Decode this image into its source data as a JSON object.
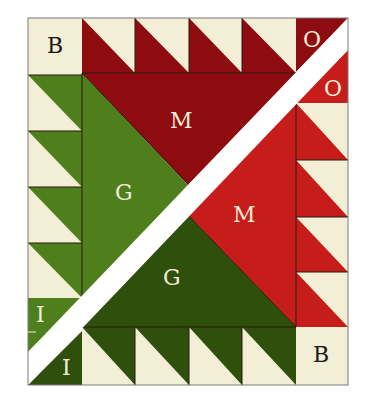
{
  "diagram": {
    "colors": {
      "cream": "#F3EED6",
      "dark_red": "#8E0C10",
      "bright_red": "#C61D1B",
      "light_green": "#4F7F1C",
      "dark_green": "#2F4F0D",
      "band": "#FFFFFF",
      "frame": "#7a7a7a"
    },
    "labels": {
      "top_left": "B",
      "top_right_upper": "O",
      "top_right_lower": "O",
      "upper_M": "M",
      "upper_G": "G",
      "lower_M": "M",
      "lower_G": "G",
      "bottom_left_upper": "I",
      "bottom_left_lower": "I",
      "bottom_right": "B"
    },
    "legend": [
      {
        "key": "B",
        "meaning": "Background corner square"
      },
      {
        "key": "O",
        "meaning": "Outer corner triangle"
      },
      {
        "key": "M",
        "meaning": "Main red triangle"
      },
      {
        "key": "G",
        "meaning": "Green triangle"
      },
      {
        "key": "I",
        "meaning": "Inner corner triangle"
      }
    ],
    "border_units": {
      "top": 4,
      "left": 4,
      "right": 4,
      "bottom": 4
    }
  }
}
